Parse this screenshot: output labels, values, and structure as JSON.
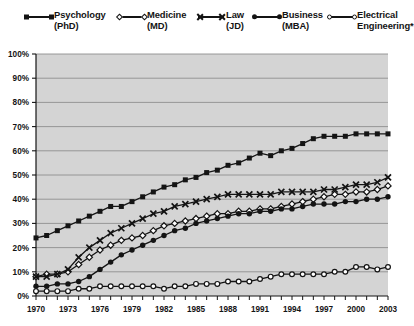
{
  "legend": {
    "items": [
      {
        "label": "Psychology\n(PhD)",
        "marker": "square-filled",
        "name": "legend-item-psychology"
      },
      {
        "label": "Medicine\n(MD)",
        "marker": "diamond-open",
        "name": "legend-item-medicine"
      },
      {
        "label": "Law\n(JD)",
        "marker": "x-mark",
        "name": "legend-item-law"
      },
      {
        "label": "Business\n(MBA)",
        "marker": "circle-filled",
        "name": "legend-item-business"
      },
      {
        "label": "Electrical\nEngineering*",
        "marker": "circle-open",
        "name": "legend-item-electrical-engineering"
      }
    ]
  },
  "chart_data": {
    "type": "line",
    "title": "",
    "subtitle": "",
    "xlabel": "",
    "ylabel": "",
    "xlim": [
      1970,
      2003
    ],
    "ylim": [
      0,
      100
    ],
    "ytick_step": 10,
    "xtick_step": 1,
    "xtick_label_step": 3,
    "grid": true,
    "grid_axis": "y",
    "legend_position": "top",
    "plot_background": "#d4d4d4",
    "line_color": "#141414",
    "ytick_labels": [
      "0%",
      "10%",
      "20%",
      "30%",
      "40%",
      "50%",
      "60%",
      "70%",
      "80%",
      "90%",
      "100%"
    ],
    "yticks": [
      0,
      10,
      20,
      30,
      40,
      50,
      60,
      70,
      80,
      90,
      100
    ],
    "x": [
      1970,
      1971,
      1972,
      1973,
      1974,
      1975,
      1976,
      1977,
      1978,
      1979,
      1980,
      1981,
      1982,
      1983,
      1984,
      1985,
      1986,
      1987,
      1988,
      1989,
      1990,
      1991,
      1992,
      1993,
      1994,
      1995,
      1996,
      1997,
      1998,
      1999,
      2000,
      2001,
      2002,
      2003
    ],
    "xtick_labels": [
      "1970",
      "1973",
      "1976",
      "1979",
      "1982",
      "1985",
      "1988",
      "1991",
      "1994",
      "1997",
      "2000",
      "2003"
    ],
    "series": [
      {
        "name": "Psychology (PhD)",
        "marker": "square-filled",
        "values": [
          24,
          25,
          27,
          29,
          31,
          33,
          35,
          37,
          37,
          39,
          41,
          43,
          45,
          46,
          48,
          49,
          51,
          52,
          54,
          55,
          57,
          59,
          58,
          60,
          61,
          63,
          65,
          66,
          66,
          66,
          67,
          67,
          67,
          67
        ]
      },
      {
        "name": "Medicine (MD)",
        "marker": "diamond-open",
        "values": [
          8,
          9,
          9,
          10,
          13,
          16,
          19,
          21,
          23,
          24,
          25,
          27,
          29,
          30,
          31,
          32,
          33,
          34,
          34,
          35,
          35,
          36,
          36,
          37,
          38,
          39,
          40,
          41,
          42,
          42,
          43,
          43,
          44,
          45.5
        ]
      },
      {
        "name": "Law (JD)",
        "marker": "x-mark",
        "values": [
          8,
          8,
          9,
          11,
          16,
          20,
          23,
          26,
          28,
          30,
          32,
          34,
          35,
          37,
          38,
          39,
          40,
          41,
          42,
          42,
          42,
          42,
          42,
          43,
          43,
          43,
          43,
          44,
          44,
          45,
          46,
          46,
          47,
          49
        ]
      },
      {
        "name": "Business (MBA)",
        "marker": "circle-filled",
        "values": [
          4,
          4,
          5,
          5,
          6,
          8,
          11,
          14,
          17,
          19,
          21,
          23,
          25,
          27,
          28,
          30,
          31,
          32,
          33,
          34,
          34,
          35,
          35,
          36,
          36,
          37,
          38,
          38,
          38,
          39,
          39,
          40,
          40,
          41
        ]
      },
      {
        "name": "Electrical Engineering*",
        "marker": "circle-open",
        "values": [
          2,
          2,
          2,
          2,
          3,
          3,
          4,
          4,
          4,
          4,
          4,
          4,
          3,
          4,
          4,
          5,
          5,
          5,
          6,
          6,
          6,
          7,
          8,
          9,
          9,
          9,
          9,
          9,
          10,
          10,
          12,
          12,
          11,
          12
        ]
      }
    ]
  }
}
